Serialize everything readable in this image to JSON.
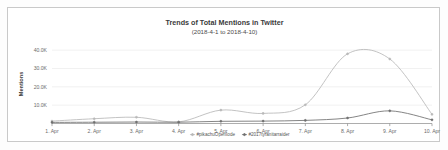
{
  "chart_data": {
    "type": "line",
    "title": "Trends of Total Mentions in Twitter",
    "subtitle": "(2018-4-1 to 2018-4-10)",
    "xlabel": "",
    "ylabel": "Mentions",
    "categories": [
      "1. Apr",
      "2. Apr",
      "3. Apr",
      "4. Apr",
      "5. Apr",
      "6. Apr",
      "7. Apr",
      "8. Apr",
      "9. Apr",
      "10. Apr"
    ],
    "ytick_labels": [
      "10.0K",
      "20.0K",
      "30.0K",
      "40.0K"
    ],
    "ytick_values": [
      10000,
      20000,
      30000,
      40000
    ],
    "ylim": [
      0,
      45000
    ],
    "grid": true,
    "legend_position": "bottom",
    "series": [
      {
        "name": "#pikachuOpenIode",
        "color": "#b8b8b8",
        "marker": "circle",
        "values": [
          1300,
          2600,
          3400,
          900,
          7300,
          5500,
          10200,
          38000,
          35200,
          5000
        ]
      },
      {
        "name": "#2017tyranitarraider",
        "color": "#6f6f6f",
        "marker": "circle",
        "values": [
          600,
          700,
          800,
          700,
          1200,
          1300,
          1700,
          3000,
          6900,
          2000
        ]
      }
    ]
  },
  "axes": {
    "y_axis_title": "Mentions"
  }
}
